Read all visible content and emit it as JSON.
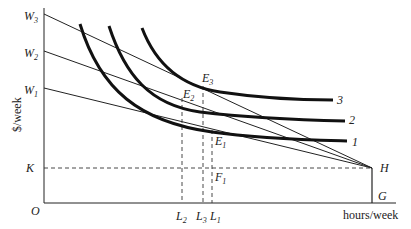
{
  "diagram": {
    "y_axis_label": "$/week",
    "x_axis_label": "hours/week",
    "origin_label": "O",
    "y_ticks": [
      {
        "base": "W",
        "sub": "3"
      },
      {
        "base": "W",
        "sub": "2"
      },
      {
        "base": "W",
        "sub": "1"
      },
      {
        "base": "K",
        "sub": ""
      }
    ],
    "x_ticks": [
      {
        "base": "L",
        "sub": "2"
      },
      {
        "base": "L",
        "sub": "3"
      },
      {
        "base": "L",
        "sub": "1"
      }
    ],
    "points": {
      "H": "H",
      "G": "G",
      "E1": {
        "base": "E",
        "sub": "1"
      },
      "E2": {
        "base": "E",
        "sub": "2"
      },
      "E3": {
        "base": "E",
        "sub": "3"
      },
      "F1": {
        "base": "F",
        "sub": "1"
      }
    },
    "curve_labels": [
      "1",
      "2",
      "3"
    ],
    "colors": {
      "line": "#111111",
      "text": "#222222"
    }
  }
}
